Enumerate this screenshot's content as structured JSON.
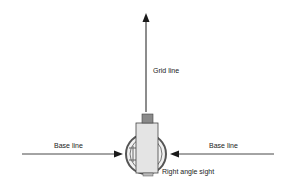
{
  "diagram": {
    "labels": {
      "grid_line": "Grid line",
      "base_line_left": "Base line",
      "base_line_right": "Base line",
      "right_angle_sight": "Right angle sight"
    },
    "colors": {
      "line": "#1a1a1a",
      "body_fill": "#e4e4e4",
      "cap_fill": "#8a8a8a",
      "ring": "#555555"
    }
  }
}
